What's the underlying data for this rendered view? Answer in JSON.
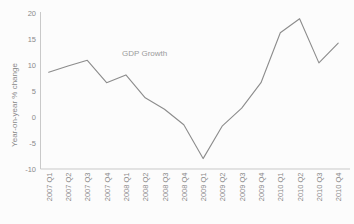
{
  "chart_data": {
    "type": "line",
    "title": "",
    "series_label": "GDP Growth",
    "categories": [
      "2007 Q1",
      "2007 Q2",
      "2007 Q3",
      "2007 Q4",
      "2008 Q1",
      "2008 Q2",
      "2008 Q3",
      "2008 Q4",
      "2009 Q1",
      "2009 Q2",
      "2009 Q3",
      "2009 Q4",
      "2010 Q1",
      "2010 Q2",
      "2010 Q3",
      "2010 Q4"
    ],
    "values": [
      8.6,
      9.8,
      10.9,
      6.6,
      8.1,
      3.7,
      1.5,
      -1.5,
      -8.0,
      -1.7,
      1.7,
      6.6,
      16.2,
      18.9,
      10.4,
      14.2
    ],
    "xlabel": "",
    "ylabel": "Year-on-year % change",
    "yticks": [
      20,
      15,
      10,
      5,
      0,
      -5,
      -10
    ],
    "ylim": [
      -10,
      20
    ],
    "grid": false,
    "legend_position": "inline-annotation",
    "colors": {
      "line": "#8c8c8c",
      "axis": "#c9c9c9",
      "text": "#8a8a8a",
      "annotation": "#9b9b9b",
      "background": "#fcfcfc"
    }
  }
}
